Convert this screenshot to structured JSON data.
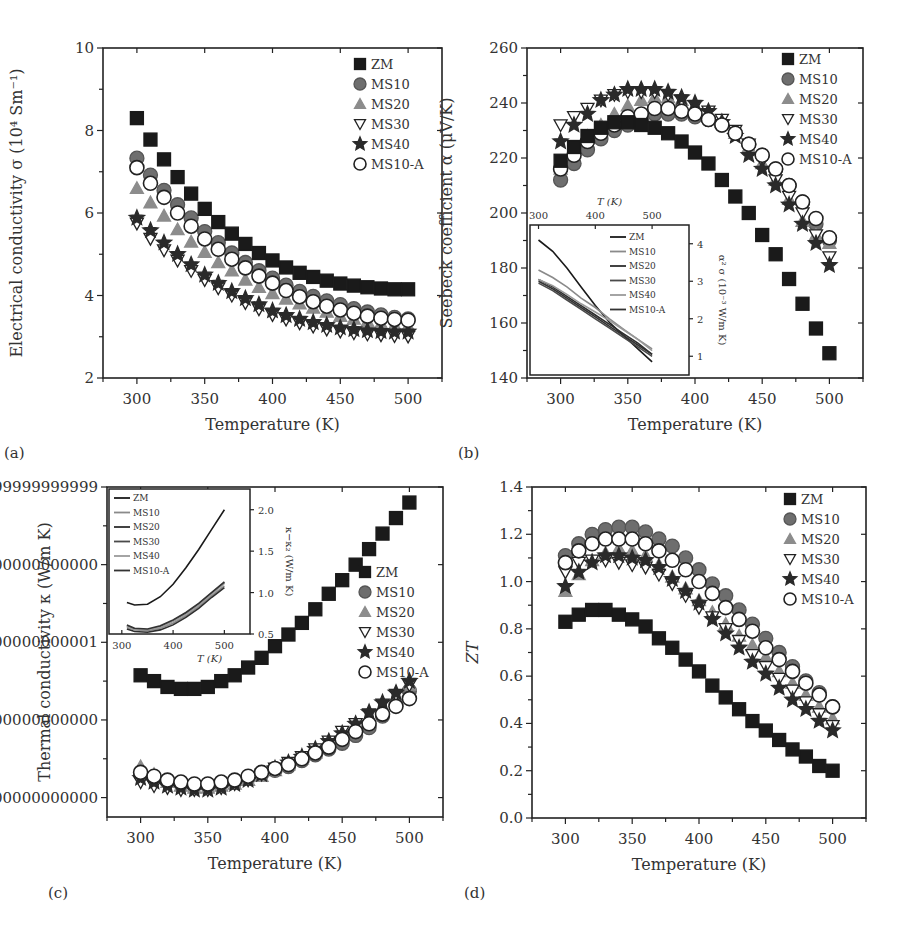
{
  "series_names": [
    "ZM",
    "MS10",
    "MS20",
    "MS30",
    "MS40",
    "MS10-A"
  ],
  "chart_data": [
    {
      "id": "a",
      "panel_label": "(a)",
      "type": "scatter",
      "xlabel": "Temperature (K)",
      "ylabel": "Electrical conductivity σ (10⁴ Sm⁻¹)",
      "xlim": [
        275,
        525
      ],
      "ylim": [
        2,
        10
      ],
      "xticks": [
        300,
        350,
        400,
        450,
        500
      ],
      "yticks": [
        2,
        4,
        6,
        8,
        10
      ],
      "legend_position": "upper right",
      "x": [
        300,
        310,
        320,
        330,
        340,
        350,
        360,
        370,
        380,
        390,
        400,
        410,
        420,
        430,
        440,
        450,
        460,
        470,
        480,
        490,
        500
      ],
      "series": [
        {
          "name": "ZM",
          "values": [
            8.3,
            7.78,
            7.3,
            6.87,
            6.47,
            6.1,
            5.78,
            5.5,
            5.25,
            5.03,
            4.85,
            4.68,
            4.55,
            4.45,
            4.36,
            4.29,
            4.24,
            4.2,
            4.17,
            4.15,
            4.15
          ]
        },
        {
          "name": "MS10",
          "values": [
            7.33,
            6.92,
            6.55,
            6.2,
            5.88,
            5.55,
            5.28,
            5.03,
            4.8,
            4.6,
            4.42,
            4.25,
            4.1,
            3.98,
            3.87,
            3.78,
            3.68,
            3.6,
            3.53,
            3.47,
            3.43
          ]
        },
        {
          "name": "MS20",
          "values": [
            6.6,
            6.25,
            5.93,
            5.6,
            5.3,
            5.05,
            4.8,
            4.6,
            4.38,
            4.2,
            4.05,
            3.92,
            3.8,
            3.7,
            3.6,
            3.5,
            3.43,
            3.37,
            3.32,
            3.28,
            3.26
          ]
        },
        {
          "name": "MS30",
          "values": [
            5.75,
            5.38,
            5.1,
            4.85,
            4.6,
            4.38,
            4.18,
            4.0,
            3.82,
            3.67,
            3.53,
            3.42,
            3.33,
            3.25,
            3.18,
            3.13,
            3.09,
            3.06,
            3.04,
            3.02,
            3.01
          ]
        },
        {
          "name": "MS40",
          "values": [
            5.88,
            5.58,
            5.28,
            5.0,
            4.75,
            4.5,
            4.3,
            4.1,
            3.93,
            3.78,
            3.63,
            3.52,
            3.43,
            3.35,
            3.28,
            3.22,
            3.18,
            3.15,
            3.13,
            3.12,
            3.12
          ]
        },
        {
          "name": "MS10-A",
          "values": [
            7.1,
            6.72,
            6.38,
            6.0,
            5.68,
            5.37,
            5.12,
            4.88,
            4.67,
            4.47,
            4.3,
            4.12,
            3.97,
            3.85,
            3.74,
            3.65,
            3.57,
            3.5,
            3.45,
            3.42,
            3.4
          ]
        }
      ]
    },
    {
      "id": "b",
      "panel_label": "(b)",
      "type": "scatter",
      "xlabel": "Temperature (K)",
      "ylabel": "Seebeck coefficient α (μV/K)",
      "xlim": [
        275,
        525
      ],
      "ylim": [
        140,
        260
      ],
      "xticks": [
        300,
        350,
        400,
        450,
        500
      ],
      "yticks": [
        140,
        160,
        180,
        200,
        220,
        240,
        260
      ],
      "legend_position": "upper right",
      "x": [
        300,
        310,
        320,
        330,
        340,
        350,
        360,
        370,
        380,
        390,
        400,
        410,
        420,
        430,
        440,
        450,
        460,
        470,
        480,
        490,
        500
      ],
      "series": [
        {
          "name": "ZM",
          "values": [
            219,
            224,
            228,
            231,
            233,
            233,
            232,
            231,
            229,
            226,
            222,
            218,
            212,
            206,
            200,
            192,
            185,
            176,
            167,
            158,
            149
          ]
        },
        {
          "name": "MS10",
          "values": [
            212,
            218,
            223,
            227,
            230,
            232,
            234,
            236,
            236,
            236,
            235,
            234,
            232,
            229,
            225,
            221,
            216,
            210,
            204,
            196,
            190
          ]
        },
        {
          "name": "MS20",
          "values": [
            216,
            222,
            228,
            232,
            236,
            239,
            241,
            242,
            242,
            241,
            239,
            236,
            233,
            229,
            224,
            218,
            212,
            205,
            197,
            192,
            189
          ]
        },
        {
          "name": "MS30",
          "values": [
            232,
            235,
            238,
            241,
            243,
            244,
            244,
            244,
            243,
            241,
            239,
            237,
            234,
            230,
            225,
            219,
            212,
            206,
            200,
            192,
            184
          ]
        },
        {
          "name": "MS40",
          "values": [
            226,
            232,
            236,
            241,
            243,
            245,
            245,
            245,
            244,
            242,
            240,
            237,
            233,
            228,
            221,
            216,
            210,
            203,
            196,
            189,
            181
          ]
        },
        {
          "name": "MS10-A",
          "values": [
            216,
            221,
            226,
            229,
            232,
            235,
            236,
            238,
            238,
            237,
            236,
            234,
            232,
            229,
            225,
            221,
            216,
            210,
            204,
            198,
            191
          ]
        }
      ],
      "inset": {
        "type": "line",
        "xlabel": "T (K)",
        "ylabel": "α² σ (10⁻³ W/m K)",
        "xlim": [
          285,
          565
        ],
        "ylim": [
          0.5,
          4.5
        ],
        "xticks": [
          300,
          400,
          500
        ],
        "yticks": [
          1,
          2,
          3,
          4
        ],
        "x": [
          300,
          325,
          350,
          375,
          400,
          425,
          450,
          475,
          500
        ],
        "series": [
          {
            "name": "ZM",
            "values": [
              4.1,
              3.8,
              3.35,
              2.85,
              2.35,
              1.9,
              1.55,
              1.2,
              0.85
            ]
          },
          {
            "name": "MS10",
            "values": [
              3.3,
              3.1,
              2.85,
              2.55,
              2.3,
              2.0,
              1.72,
              1.45,
              1.2
            ]
          },
          {
            "name": "MS20",
            "values": [
              3.05,
              2.85,
              2.6,
              2.35,
              2.1,
              1.85,
              1.6,
              1.35,
              1.05
            ]
          },
          {
            "name": "MS30",
            "values": [
              2.95,
              2.75,
              2.5,
              2.25,
              2.0,
              1.75,
              1.5,
              1.25,
              1.0
            ]
          },
          {
            "name": "MS40",
            "values": [
              3.05,
              2.88,
              2.65,
              2.4,
              2.18,
              1.95,
              1.7,
              1.45,
              1.15
            ]
          },
          {
            "name": "MS10-A",
            "values": [
              3.0,
              2.8,
              2.55,
              2.3,
              2.05,
              1.8,
              1.55,
              1.3,
              1.05
            ]
          }
        ]
      }
    },
    {
      "id": "c",
      "panel_label": "(c)",
      "type": "scatter",
      "xlabel": "Temperature (K)",
      "ylabel": "Thermal conductivity κ (W/m K)",
      "xlim": [
        275,
        525
      ],
      "ylim": [
        0.7,
        2.4
      ],
      "xticks": [
        300,
        350,
        400,
        450,
        500
      ],
      "yticks": [
        0.8,
        1.2,
        1.6,
        2.0,
        2.4
      ],
      "legend_position": "center right",
      "x": [
        300,
        310,
        320,
        330,
        340,
        350,
        360,
        370,
        380,
        390,
        400,
        410,
        420,
        430,
        440,
        450,
        460,
        470,
        480,
        490,
        500
      ],
      "series": [
        {
          "name": "ZM",
          "values": [
            1.43,
            1.4,
            1.37,
            1.36,
            1.36,
            1.37,
            1.4,
            1.43,
            1.47,
            1.52,
            1.58,
            1.64,
            1.7,
            1.77,
            1.85,
            1.92,
            2.0,
            2.08,
            2.16,
            2.24,
            2.32
          ]
        },
        {
          "name": "MS10",
          "values": [
            0.92,
            0.9,
            0.88,
            0.87,
            0.86,
            0.86,
            0.87,
            0.88,
            0.9,
            0.92,
            0.94,
            0.96,
            0.99,
            1.02,
            1.05,
            1.08,
            1.12,
            1.16,
            1.22,
            1.28,
            1.35
          ]
        },
        {
          "name": "MS20",
          "values": [
            0.96,
            0.92,
            0.88,
            0.86,
            0.85,
            0.85,
            0.86,
            0.87,
            0.89,
            0.91,
            0.94,
            0.97,
            1.0,
            1.03,
            1.07,
            1.11,
            1.16,
            1.2,
            1.26,
            1.32,
            1.38
          ]
        },
        {
          "name": "MS30",
          "values": [
            0.88,
            0.86,
            0.85,
            0.84,
            0.84,
            0.84,
            0.85,
            0.87,
            0.89,
            0.92,
            0.95,
            0.98,
            1.01,
            1.05,
            1.09,
            1.14,
            1.18,
            1.23,
            1.28,
            1.33,
            1.38
          ]
        },
        {
          "name": "MS40",
          "values": [
            0.9,
            0.88,
            0.86,
            0.85,
            0.84,
            0.84,
            0.85,
            0.87,
            0.89,
            0.92,
            0.95,
            0.98,
            1.01,
            1.05,
            1.09,
            1.13,
            1.18,
            1.24,
            1.29,
            1.34,
            1.4
          ]
        },
        {
          "name": "MS10-A",
          "values": [
            0.93,
            0.91,
            0.89,
            0.88,
            0.87,
            0.87,
            0.88,
            0.89,
            0.91,
            0.93,
            0.95,
            0.97,
            1.0,
            1.03,
            1.06,
            1.1,
            1.14,
            1.18,
            1.23,
            1.27,
            1.31
          ]
        }
      ],
      "inset": {
        "type": "line",
        "xlabel": "T (K)",
        "ylabel": "κ−κ₂ (W/m K)",
        "xlim": [
          275,
          550
        ],
        "ylim": [
          0.5,
          2.25
        ],
        "xticks": [
          300,
          400,
          500
        ],
        "yticks": [
          0.5,
          1.0,
          1.5,
          2.0
        ],
        "x": [
          310,
          325,
          350,
          375,
          400,
          425,
          450,
          475,
          500
        ],
        "series": [
          {
            "name": "ZM",
            "values": [
              0.88,
              0.85,
              0.86,
              0.95,
              1.1,
              1.3,
              1.52,
              1.76,
              2.0
            ]
          },
          {
            "name": "MS10",
            "values": [
              0.58,
              0.55,
              0.54,
              0.57,
              0.63,
              0.72,
              0.83,
              0.96,
              1.08
            ]
          },
          {
            "name": "MS20",
            "values": [
              0.56,
              0.53,
              0.52,
              0.55,
              0.61,
              0.7,
              0.81,
              0.94,
              1.06
            ]
          },
          {
            "name": "MS30",
            "values": [
              0.6,
              0.56,
              0.55,
              0.59,
              0.66,
              0.75,
              0.86,
              0.99,
              1.12
            ]
          },
          {
            "name": "MS40",
            "values": [
              0.59,
              0.55,
              0.55,
              0.58,
              0.65,
              0.74,
              0.85,
              0.98,
              1.11
            ]
          },
          {
            "name": "MS10-A",
            "values": [
              0.61,
              0.57,
              0.56,
              0.6,
              0.67,
              0.76,
              0.87,
              1.0,
              1.13
            ]
          }
        ]
      }
    },
    {
      "id": "d",
      "panel_label": "(d)",
      "type": "scatter",
      "xlabel": "Temperature (K)",
      "ylabel": "ZT",
      "xlim": [
        275,
        525
      ],
      "ylim": [
        0,
        1.4
      ],
      "xticks": [
        300,
        350,
        400,
        450,
        500
      ],
      "yticks": [
        0.0,
        0.2,
        0.4,
        0.6,
        0.8,
        1.0,
        1.2,
        1.4
      ],
      "legend_position": "upper right",
      "x": [
        300,
        310,
        320,
        330,
        340,
        350,
        360,
        370,
        380,
        390,
        400,
        410,
        420,
        430,
        440,
        450,
        460,
        470,
        480,
        490,
        500
      ],
      "series": [
        {
          "name": "ZM",
          "values": [
            0.83,
            0.86,
            0.88,
            0.88,
            0.86,
            0.84,
            0.81,
            0.76,
            0.72,
            0.67,
            0.62,
            0.56,
            0.51,
            0.46,
            0.41,
            0.37,
            0.33,
            0.29,
            0.26,
            0.22,
            0.2
          ]
        },
        {
          "name": "MS10",
          "values": [
            1.11,
            1.16,
            1.2,
            1.22,
            1.23,
            1.23,
            1.21,
            1.18,
            1.15,
            1.1,
            1.05,
            0.99,
            0.94,
            0.88,
            0.82,
            0.76,
            0.7,
            0.64,
            0.58,
            0.53,
            0.47
          ]
        },
        {
          "name": "MS20",
          "values": [
            0.96,
            1.03,
            1.09,
            1.12,
            1.14,
            1.13,
            1.11,
            1.07,
            1.02,
            0.97,
            0.92,
            0.87,
            0.82,
            0.77,
            0.73,
            0.68,
            0.62,
            0.57,
            0.52,
            0.47,
            0.42
          ]
        },
        {
          "name": "MS30",
          "values": [
            1.04,
            1.08,
            1.09,
            1.09,
            1.08,
            1.07,
            1.06,
            1.03,
            0.99,
            0.94,
            0.89,
            0.85,
            0.8,
            0.75,
            0.69,
            0.64,
            0.59,
            0.54,
            0.49,
            0.44,
            0.39
          ]
        },
        {
          "name": "MS40",
          "values": [
            0.98,
            1.04,
            1.08,
            1.11,
            1.11,
            1.1,
            1.09,
            1.06,
            1.01,
            0.96,
            0.91,
            0.84,
            0.78,
            0.72,
            0.66,
            0.61,
            0.55,
            0.5,
            0.46,
            0.41,
            0.37
          ]
        },
        {
          "name": "MS10-A",
          "values": [
            1.08,
            1.13,
            1.16,
            1.18,
            1.18,
            1.18,
            1.16,
            1.13,
            1.09,
            1.05,
            1.0,
            0.95,
            0.89,
            0.84,
            0.79,
            0.72,
            0.67,
            0.62,
            0.57,
            0.52,
            0.47
          ]
        }
      ]
    }
  ],
  "styles": {
    "ZM": {
      "marker": "square",
      "fill": "#1a1a1a",
      "stroke": "#1a1a1a"
    },
    "MS10": {
      "marker": "circle",
      "fill": "#6e6e6e",
      "stroke": "#555555"
    },
    "MS20": {
      "marker": "triangle-up",
      "fill": "#8c8c8c",
      "stroke": "#8c8c8c"
    },
    "MS30": {
      "marker": "triangle-down",
      "fill": "#ffffff",
      "stroke": "#222222"
    },
    "MS40": {
      "marker": "star",
      "fill": "#2a2a2a",
      "stroke": "#2a2a2a"
    },
    "MS10-A": {
      "marker": "circle-open",
      "fill": "#ffffff",
      "stroke": "#222222"
    }
  },
  "inset_line_colors": {
    "ZM": "#1a1a1a",
    "MS10": "#8a8a8a",
    "MS20": "#2e2e2e",
    "MS30": "#4a4a4a",
    "MS40": "#9a9a9a",
    "MS10-A": "#333333"
  }
}
